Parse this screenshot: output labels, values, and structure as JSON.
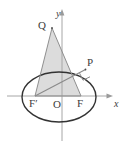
{
  "figure": {
    "background": "#ffffff",
    "stroke_color": "#3b3b3b",
    "axis_color": "#9a9a9a",
    "fill_color": "#dcdcdc",
    "chord_color": "#8c8c8c"
  },
  "axes": {
    "x_label": "x",
    "y_label": "y",
    "x_axis_name": "x-axis",
    "y_axis_name": "y-axis"
  },
  "points": [
    {
      "id": "Q",
      "label": "Q",
      "x": 52,
      "y": 28,
      "label_x": 40,
      "label_y": 21
    },
    {
      "id": "P",
      "label": "P",
      "x": 85,
      "y": 70,
      "label_x": 87,
      "label_y": 60
    },
    {
      "id": "F_prime",
      "label": "F",
      "prime": "′",
      "x": 35,
      "y": 96,
      "label_x": 30,
      "label_y": 98
    },
    {
      "id": "O",
      "label": "O",
      "x": 59,
      "y": 96,
      "label_x": 54,
      "label_y": 99
    },
    {
      "id": "F",
      "label": "F",
      "x": 81,
      "y": 96,
      "label_x": 78,
      "label_y": 98
    }
  ],
  "ellipse": {
    "center_x": 59,
    "center_y": 97,
    "radius_x": 37,
    "radius_y": 25
  },
  "triangle": {
    "vertices": "52,28 35,96 81,96",
    "name": "triangle-QFprimeF"
  },
  "segments": [
    {
      "name": "segment-Fprime-P",
      "x1": 35,
      "y1": 96,
      "x2": 85,
      "y2": 70
    },
    {
      "name": "segment-Q-Fprime",
      "x1": 52,
      "y1": 28,
      "x2": 35,
      "y2": 96
    },
    {
      "name": "segment-Q-F",
      "x1": 52,
      "y1": 28,
      "x2": 81,
      "y2": 96
    }
  ],
  "right_angle_marker": {
    "name": "right-angle-marker-at-P",
    "path": "M 79.2 73.5 L 82.4 80.6 L 89.6 77.4"
  }
}
